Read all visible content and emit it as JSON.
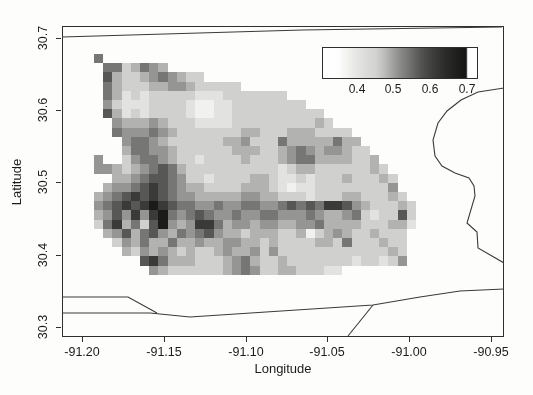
{
  "figure": {
    "width": 533,
    "height": 395,
    "background": "#fdfdfc",
    "ink_color": "#2f2f2f"
  },
  "axes": {
    "xlabel": "Longitude",
    "ylabel": "Latitude",
    "x_ticks": [
      {
        "label": "-91.20",
        "px": 82
      },
      {
        "label": "-91.15",
        "px": 164
      },
      {
        "label": "-91.10",
        "px": 246
      },
      {
        "label": "-91.05",
        "px": 327
      },
      {
        "label": "-91.00",
        "px": 409
      },
      {
        "label": "-90.95",
        "px": 491
      }
    ],
    "y_ticks": [
      {
        "label": "30.7",
        "px": 38
      },
      {
        "label": "30.6",
        "px": 110
      },
      {
        "label": "30.5",
        "px": 182
      },
      {
        "label": "30.4",
        "px": 255
      },
      {
        "label": "30.3",
        "px": 327
      }
    ],
    "plot_box_px": {
      "left": 62,
      "top": 26,
      "width": 442,
      "height": 311
    }
  },
  "colorbar": {
    "ticks": [
      {
        "label": "0.4",
        "offset_px": 35
      },
      {
        "label": "0.5",
        "offset_px": 71
      },
      {
        "label": "0.6",
        "offset_px": 108
      },
      {
        "label": "0.7",
        "offset_px": 145
      }
    ],
    "box_px": {
      "left": 322,
      "top": 47,
      "width": 156,
      "height": 32
    },
    "gradient_stops": [
      "#ffffff 0%",
      "#fdfdfd 10%",
      "#ededea 18%",
      "#dedfdc 26%",
      "#d3d4d1 34%",
      "#bcbdba 40%",
      "#a3a4a1 45%",
      "#8b8c89 50%",
      "#6f706e 57%",
      "#525351 64%",
      "#3c3c3a 72%",
      "#2a2a28 80%",
      "#1d1d1b 88%",
      "#161614 93%",
      "#ffffff 94%",
      "#ffffff 100%"
    ]
  },
  "chart_data": {
    "type": "heatmap",
    "title": "",
    "xlabel": "Longitude",
    "ylabel": "Latitude",
    "xlim": [
      -91.2125,
      -90.9475
    ],
    "ylim": [
      30.285,
      30.717
    ],
    "x_tick_values": [
      -91.2,
      -91.15,
      -91.1,
      -91.05,
      -91.0,
      -90.95
    ],
    "y_tick_values": [
      30.7,
      30.6,
      30.5,
      30.4,
      30.3
    ],
    "colorbar_tick_values": [
      0.4,
      0.5,
      0.6,
      0.7
    ],
    "value_range": [
      0.33,
      0.72
    ],
    "grid_geo": {
      "lon_origin": -91.1935,
      "lat_origin": 30.679,
      "dlon_per_cell": 0.00548,
      "dlat_per_cell": -0.01278,
      "ncols": 35,
      "nrows": 24
    },
    "grid_px": {
      "origin_x": 31,
      "origin_y": 27,
      "cell": 9.2
    },
    "shade_to_value": {
      "1": 0.36,
      "2": 0.39,
      "3": 0.42,
      "4": 0.47,
      "5": 0.52,
      "6": 0.57,
      "7": 0.62,
      "8": 0.67,
      "9": 0.71
    },
    "shade_palette": {
      "1": "#f1f1ef",
      "2": "#e2e2e0",
      "3": "#d0d1ce",
      "4": "#b2b3b0",
      "5": "#959694",
      "6": "#767775",
      "7": "#575856",
      "8": "#3a3a38",
      "9": "#1b1b1a"
    },
    "grid": [
      "6..................................",
      ".6634654...........................",
      ".74334565433.......................",
      ".643334455433333...................",
      ".64232333332223333333..............",
      ".5322233332112233333333............",
      ".742323333211223333333333..........",
      "..544454333222233333333343.........",
      "..65556543333333443334443333.......",
      "...56654333333445333644444644......",
      "...466554333333444334565455433.....",
      "5..3566543323333433345664444334....",
      "55434567643333333333234433333343...",
      "..4456776533233334432232333433343..",
      ".45567876544333344432122333333335..",
      "4567878765544444554433323334433343.",
      "56787898766556556655676768875433343",
      "45758589656765565566555654456323373",
      "36846379545886455455445564444333442",
      ".457467546567544344433413454334333.",
      "..35464464454455443433334436333433.",
      "...4354543433454453533333333333343.",
      ".....78644433345643343333333233235.",
      "......543333334565334433322........"
    ],
    "boundary_lines_px": [
      {
        "name": "north-boundary",
        "points": [
          [
            0,
            11
          ],
          [
            240,
            4
          ],
          [
            440,
            1
          ]
        ]
      },
      {
        "name": "east-boundary",
        "points": [
          [
            442,
            62
          ],
          [
            416,
            66
          ],
          [
            399,
            74
          ],
          [
            385,
            85
          ],
          [
            376,
            97
          ],
          [
            371,
            114
          ],
          [
            373,
            130
          ],
          [
            380,
            140
          ],
          [
            393,
            147
          ],
          [
            407,
            152
          ],
          [
            412,
            160
          ],
          [
            413,
            170
          ],
          [
            405,
            197
          ],
          [
            415,
            206
          ],
          [
            416,
            222
          ],
          [
            442,
            237
          ]
        ]
      },
      {
        "name": "south-boundary-upper",
        "points": [
          [
            0,
            271
          ],
          [
            66,
            271
          ],
          [
            95,
            287
          ]
        ]
      },
      {
        "name": "south-boundary-lower",
        "points": [
          [
            0,
            287
          ],
          [
            88,
            287
          ],
          [
            128,
            291
          ],
          [
            204,
            286
          ],
          [
            311,
            279
          ],
          [
            358,
            271
          ],
          [
            398,
            265
          ],
          [
            442,
            263
          ]
        ]
      },
      {
        "name": "south-diagonal",
        "points": [
          [
            286,
            310
          ],
          [
            311,
            279
          ]
        ]
      }
    ]
  }
}
